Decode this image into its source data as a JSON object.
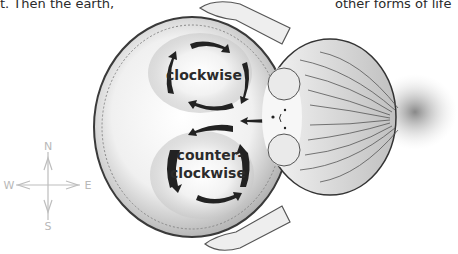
{
  "text_fragments": {
    "left": "t. Then the earth,",
    "right": "other forms of life"
  },
  "illustration": {
    "subject": "girl viewed from above holding a globe",
    "globe_labels": {
      "upper": "clockwise",
      "lower_line1": "counter-",
      "lower_line2": "clockwise"
    },
    "compass": {
      "north": "N",
      "south": "S",
      "east": "E",
      "west": "W"
    }
  }
}
